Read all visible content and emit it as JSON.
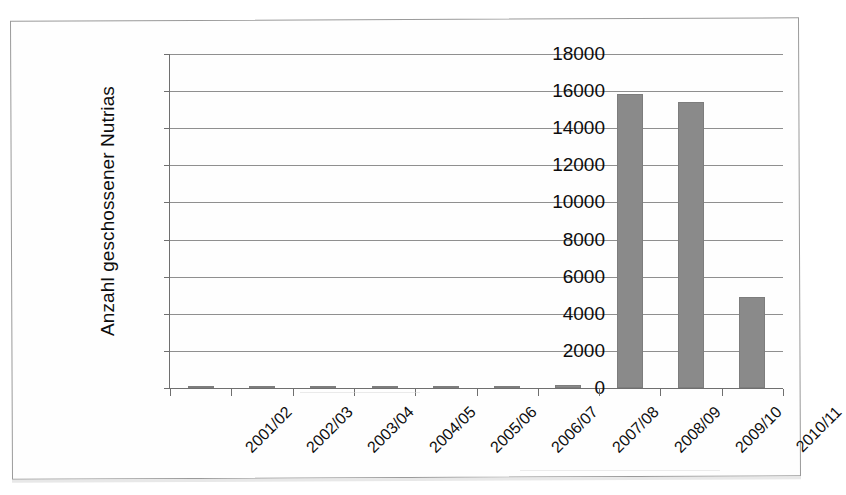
{
  "chart_data": {
    "type": "bar",
    "title": "",
    "xlabel": "",
    "ylabel": "Anzahl geschossener Nutrias",
    "ylim": [
      0,
      18000
    ],
    "ytick_step": 2000,
    "yticks": [
      "18000",
      "16000",
      "14000",
      "12000",
      "10000",
      "8000",
      "6000",
      "4000",
      "2000",
      "0"
    ],
    "grid": true,
    "legend": "none",
    "bar_color": "#8a8a8a",
    "categories": [
      "2001/02",
      "2002/03",
      "2003/04",
      "2004/05",
      "2005/06",
      "2006/07",
      "2007/08",
      "2008/09",
      "2009/10",
      "2010/11"
    ],
    "values": [
      30,
      60,
      40,
      25,
      20,
      15,
      180,
      15850,
      15400,
      4900
    ]
  },
  "axes": {
    "y_title": "Anzahl geschossener Nutrias"
  }
}
